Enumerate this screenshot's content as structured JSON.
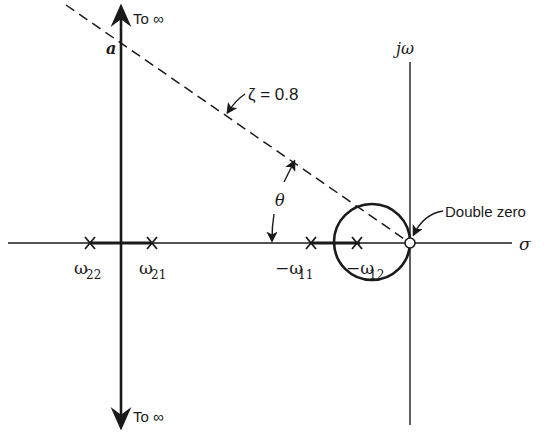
{
  "diagram": {
    "type": "root-locus",
    "axes": {
      "real_label": "σ",
      "imag_label": "jω"
    },
    "top_arrow_label": "To ∞",
    "bottom_arrow_label": "To ∞",
    "intercept_label": "a",
    "damping_line_label": "ζ = 0.8",
    "angle_label": "θ",
    "zero_label": "Double zero",
    "poles": [
      {
        "id": "w22",
        "label_main": "ω",
        "label_sub": "22"
      },
      {
        "id": "w21",
        "label_main": "ω",
        "label_sub": "21"
      },
      {
        "id": "w11",
        "label_main": "−ω",
        "label_sub": "11"
      },
      {
        "id": "w12",
        "label_main": "−ω",
        "label_sub": "12"
      }
    ]
  }
}
